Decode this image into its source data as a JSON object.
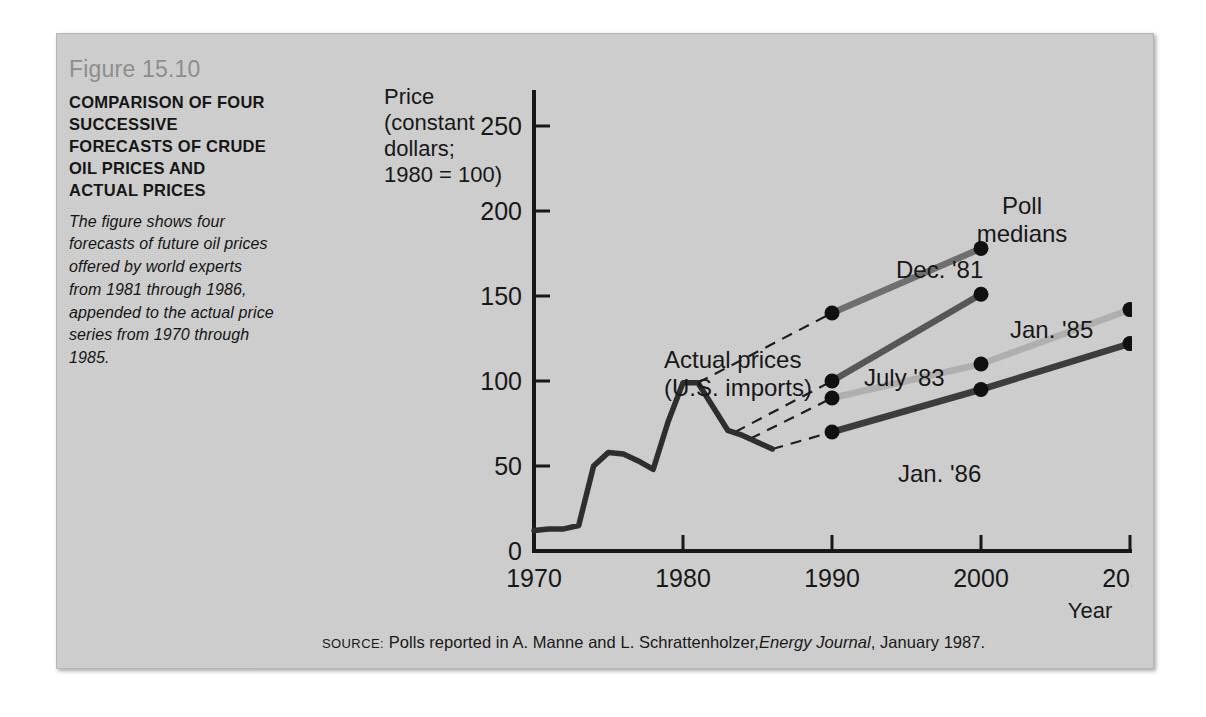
{
  "figure": {
    "number": "Figure 15.10",
    "title": "COMPARISON OF FOUR SUCCESSIVE FORECASTS OF CRUDE OIL PRICES AND ACTUAL PRICES",
    "description": "The figure shows four forecasts of future oil prices offered by world experts from 1981 through 1986, appended to the actual price series from 1970 through 1985."
  },
  "source": {
    "label": "SOURCE:",
    "text_before": "Polls reported in A. Manne and L. Schrattenholzer,",
    "journal": "Energy Journal",
    "text_after": ", January 1987."
  },
  "colors": {
    "panel_background": "#cfcfcf",
    "figure_number": "#8d8d8d",
    "axis": "#141414",
    "actual_series": "#2b2b2b",
    "dec81": "#6e6e6e",
    "july83": "#555555",
    "jan85": "#b0b0b0",
    "jan86": "#3a3a3a"
  },
  "chart_data": {
    "type": "line",
    "title": "COMPARISON OF FOUR SUCCESSIVE FORECASTS OF CRUDE OIL PRICES AND ACTUAL PRICES",
    "xlabel": "Year",
    "ylabel": "Price (constant dollars; 1980 = 100)",
    "ylabel_lines": [
      "Price",
      "(constant",
      "dollars;",
      "1980 = 100)"
    ],
    "xlim": [
      1970,
      2010
    ],
    "ylim": [
      0,
      270
    ],
    "xticks": [
      1970,
      1980,
      1990,
      2000,
      2010
    ],
    "xtick_labels": [
      "1970",
      "1980",
      "1990",
      "2000",
      "2010"
    ],
    "yticks": [
      0,
      50,
      100,
      150,
      200,
      250
    ],
    "ytick_labels": [
      "0",
      "50",
      "100",
      "150",
      "200",
      "250"
    ],
    "grid": false,
    "legend": "inline-annotations",
    "annotations": [
      {
        "name": "poll-medians",
        "text": "Poll medians",
        "lines": [
          "Poll",
          "medians"
        ],
        "x": 1995.5,
        "y": 222
      },
      {
        "name": "actual-prices",
        "text": "Actual prices (U.S. imports)",
        "lines": [
          "Actual prices",
          "(U.S. imports)"
        ],
        "x": 1979.0,
        "y": 128
      }
    ],
    "series": [
      {
        "name": "Actual prices (U.S. imports)",
        "label": "Actual prices (U.S. imports)",
        "type": "actual",
        "color": "#2b2b2b",
        "x": [
          1970,
          1971,
          1972,
          1973,
          1974,
          1975,
          1976,
          1977,
          1978,
          1979,
          1980,
          1981,
          1982,
          1983,
          1984,
          1985,
          1986
        ],
        "values": [
          12,
          13,
          13,
          15,
          50,
          58,
          57,
          53,
          48,
          76,
          99,
          99,
          85,
          71,
          68,
          64,
          60
        ]
      },
      {
        "name": "Dec. '81",
        "label": "Dec. '81",
        "type": "forecast",
        "color": "#6e6e6e",
        "x": [
          1990,
          2000
        ],
        "values": [
          140,
          178
        ],
        "anchor": {
          "x": 1981,
          "y": 99
        }
      },
      {
        "name": "July '83",
        "label": "July '83",
        "type": "forecast",
        "color": "#555555",
        "x": [
          1990,
          2000
        ],
        "values": [
          100,
          151
        ],
        "anchor": {
          "x": 1983.5,
          "y": 70
        }
      },
      {
        "name": "Jan. '85",
        "label": "Jan. '85",
        "type": "forecast",
        "color": "#b0b0b0",
        "x": [
          1990,
          2000,
          2010
        ],
        "values": [
          90,
          110,
          142
        ],
        "anchor": {
          "x": 1984.5,
          "y": 66
        }
      },
      {
        "name": "Jan. '86",
        "label": "Jan. '86",
        "type": "forecast",
        "color": "#3a3a3a",
        "x": [
          1990,
          2000,
          2010
        ],
        "values": [
          70,
          95,
          122
        ],
        "anchor": {
          "x": 1986,
          "y": 60
        }
      }
    ],
    "series_labels": [
      {
        "name": "dec81-label",
        "text": "Dec. '81",
        "x": 1991.2,
        "y": 186
      },
      {
        "name": "july83-label",
        "text": "July '83",
        "x": 1990.3,
        "y": 118
      },
      {
        "name": "jan85-label",
        "text": "Jan. '85",
        "x": 2001.6,
        "y": 152
      },
      {
        "name": "jan86-label",
        "text": "Jan. '86",
        "x": 1993.0,
        "y": 58
      }
    ]
  }
}
